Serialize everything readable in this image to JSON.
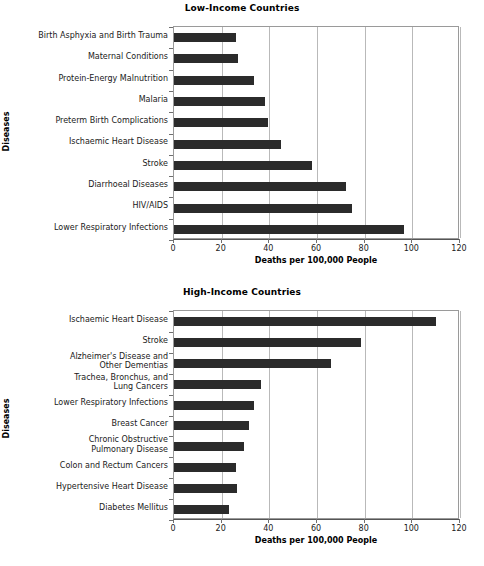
{
  "chart_data": [
    {
      "type": "bar",
      "orientation": "horizontal",
      "title": "Low-Income Countries",
      "xlabel": "Deaths per 100,000 People",
      "ylabel": "Diseases",
      "xlim": [
        0,
        120
      ],
      "xticks": [
        0,
        20,
        40,
        60,
        80,
        100,
        120
      ],
      "xticklabels": [
        "0",
        "20",
        "40",
        "60",
        "80",
        "100",
        "120"
      ],
      "grid": "vertical",
      "legend": "none",
      "bar_color": "#2b2b2b",
      "categories": [
        "Birth Asphyxia and Birth Trauma",
        "Maternal Conditions",
        "Protein-Energy Malnutrition",
        "Malaria",
        "Preterm Birth Complications",
        "Ischaemic Heart Disease",
        "Stroke",
        "Diarrhoeal Diseases",
        "HIV/AIDS",
        "Lower Respiratory Infections"
      ],
      "values": [
        26,
        27,
        33.5,
        38,
        39.5,
        45,
        58,
        72,
        74.5,
        96.5
      ]
    },
    {
      "type": "bar",
      "orientation": "horizontal",
      "title": "High-Income Countries",
      "xlabel": "Deaths per 100,000 People",
      "ylabel": "Diseases",
      "xlim": [
        0,
        120
      ],
      "xticks": [
        0,
        20,
        40,
        60,
        80,
        100,
        120
      ],
      "xticklabels": [
        "0",
        "20",
        "40",
        "60",
        "80",
        "100",
        "120"
      ],
      "grid": "vertical",
      "legend": "none",
      "bar_color": "#2b2b2b",
      "categories": [
        "Ischaemic Heart Disease",
        "Stroke",
        "Alzheimer's Disease and\nOther Dementias",
        "Trachea, Bronchus, and\nLung Cancers",
        "Lower Respiratory Infections",
        "Breast Cancer",
        "Chronic Obstructive\nPulmonary Disease",
        "Colon and Rectum Cancers",
        "Hypertensive Heart Disease",
        "Diabetes Mellitus"
      ],
      "values": [
        110,
        78.5,
        66,
        36.5,
        33.5,
        31.5,
        29.5,
        26,
        26.5,
        23
      ]
    }
  ]
}
